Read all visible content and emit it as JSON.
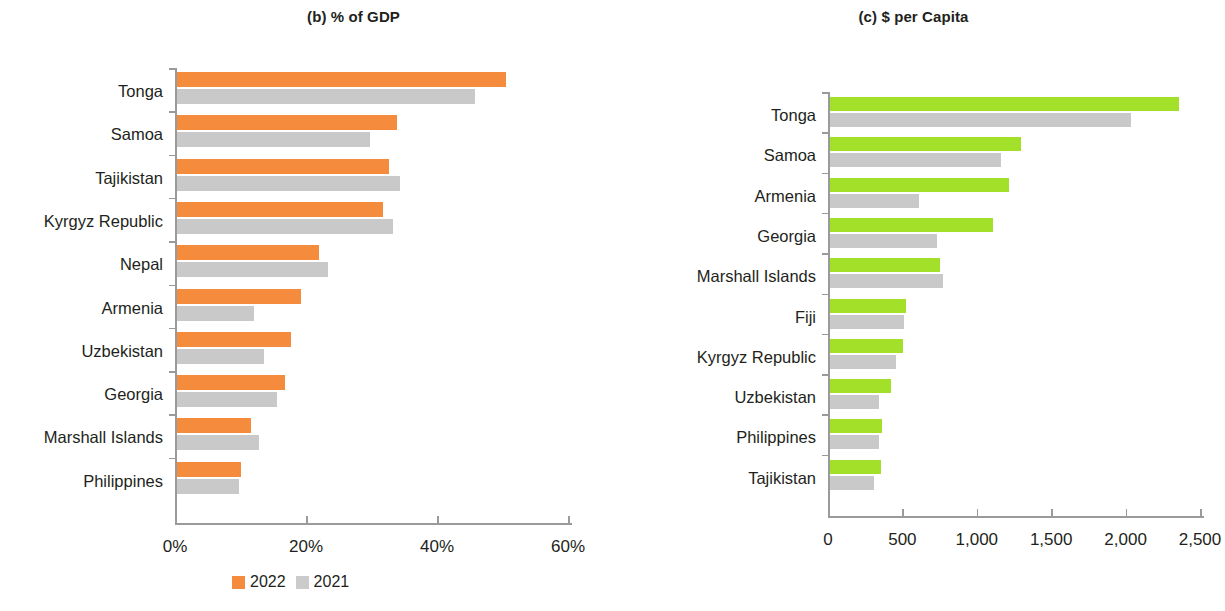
{
  "panels": {
    "b": {
      "title": "(b) % of GDP",
      "legend": [
        {
          "label": "2022",
          "color": "#f58b3c"
        },
        {
          "label": "2021",
          "color": "#cbcbcb"
        }
      ]
    },
    "c": {
      "title": "(c) $ per Capita",
      "legend": [
        {
          "label": "2022",
          "color": "#a3e02a"
        },
        {
          "label": "2021",
          "color": "#cbcbcb"
        }
      ]
    }
  },
  "chart_data": [
    {
      "type": "bar",
      "id": "percent-of-gdp",
      "title": "(b) % of GDP",
      "orientation": "horizontal",
      "xlabel": "",
      "ylabel": "",
      "xlim": [
        0,
        60
      ],
      "xticks": [
        0,
        20,
        40,
        60
      ],
      "xtick_labels": [
        "0%",
        "20%",
        "40%",
        "60%"
      ],
      "grid": false,
      "legend_position": "bottom",
      "categories": [
        "Tonga",
        "Samoa",
        "Tajikistan",
        "Kyrgyz Republic",
        "Nepal",
        "Armenia",
        "Uzbekistan",
        "Georgia",
        "Marshall Islands",
        "Philippines"
      ],
      "series": [
        {
          "name": "2022",
          "color": "#f58b3c",
          "values": [
            50.3,
            33.6,
            32.4,
            31.5,
            21.7,
            19.0,
            17.5,
            16.6,
            11.4,
            9.8
          ]
        },
        {
          "name": "2021",
          "color": "#cbcbcb",
          "values": [
            45.6,
            29.6,
            34.1,
            33.0,
            23.2,
            11.9,
            13.4,
            15.3,
            12.6,
            9.5
          ]
        }
      ]
    },
    {
      "type": "bar",
      "id": "dollars-per-capita",
      "title": "(c) $ per Capita",
      "orientation": "horizontal",
      "xlabel": "",
      "ylabel": "",
      "xlim": [
        0,
        2500
      ],
      "xticks": [
        0,
        500,
        1000,
        1500,
        2000,
        2500
      ],
      "xtick_labels": [
        "0",
        "500",
        "1,000",
        "1,500",
        "2,000",
        "2,500"
      ],
      "grid": false,
      "legend_position": "bottom",
      "categories": [
        "Tonga",
        "Samoa",
        "Armenia",
        "Georgia",
        "Marshall Islands",
        "Fiji",
        "Kyrgyz Republic",
        "Uzbekistan",
        "Philippines",
        "Tajikistan"
      ],
      "series": [
        {
          "name": "2022",
          "color": "#a3e02a",
          "values": [
            2350,
            1285,
            1205,
            1100,
            740,
            515,
            495,
            415,
            350,
            348
          ]
        },
        {
          "name": "2021",
          "color": "#cbcbcb",
          "values": [
            2025,
            1150,
            600,
            720,
            765,
            500,
            450,
            330,
            335,
            300
          ]
        }
      ]
    }
  ]
}
